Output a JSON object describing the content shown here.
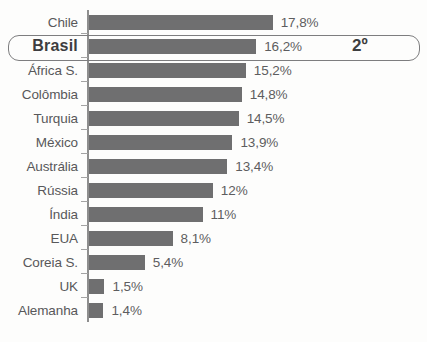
{
  "chart_data": {
    "type": "bar",
    "orientation": "horizontal",
    "title": "",
    "subtitle": "",
    "xlabel": "",
    "ylabel": "",
    "grid": false,
    "legend": null,
    "xlim": [
      0,
      17.8
    ],
    "value_suffix": "%",
    "decimal_separator": ",",
    "categories": [
      "Chile",
      "Brasil",
      "África S.",
      "Colômbia",
      "Turquia",
      "México",
      "Austrália",
      "Rússia",
      "Índia",
      "EUA",
      "Coreia S.",
      "UK",
      "Alemanha"
    ],
    "values": [
      17.8,
      16.2,
      15.2,
      14.8,
      14.5,
      13.9,
      13.4,
      12,
      11,
      8.1,
      5.4,
      1.5,
      1.4
    ],
    "value_labels": [
      "17,8%",
      "16,2%",
      "15,2%",
      "14,8%",
      "14,5%",
      "13,9%",
      "13,4%",
      "12%",
      "11%",
      "8,1%",
      "5,4%",
      "1,5%",
      "1,4%"
    ],
    "highlight": {
      "category": "Brasil",
      "index": 1,
      "rank_label": "2º"
    },
    "colors": {
      "bar": "#6f6f70",
      "label_text": "#58585a",
      "value_text": "#5d5d5f",
      "axis": "#8e8e8e",
      "highlight_border": "#7d7d7f",
      "highlight_text": "#3d3d3f",
      "background": "#fdfdfc"
    }
  }
}
